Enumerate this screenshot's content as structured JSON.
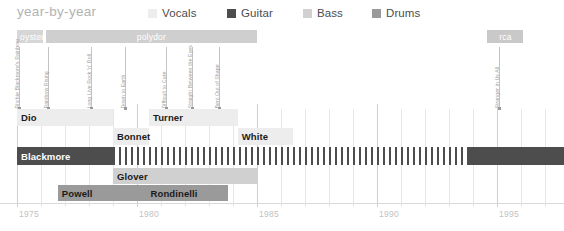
{
  "header": {
    "title": "year-by-year",
    "legend": [
      {
        "label": "Vocals",
        "color": "#ededed",
        "x": 148
      },
      {
        "label": "Guitar",
        "color": "#4d4d4d",
        "x": 227
      },
      {
        "label": "Bass",
        "color": "#d0d0d0",
        "x": 303
      },
      {
        "label": "Drums",
        "color": "#9a9a9a",
        "x": 372
      }
    ]
  },
  "chart_data": {
    "type": "timeline",
    "title": "year-by-year",
    "xlabel": "",
    "ylabel": "",
    "xlim": [
      1975,
      1997.8
    ],
    "x_ticks": [
      1975,
      1980,
      1985,
      1990,
      1995
    ],
    "x_tick_labels": [
      "1975",
      "1980",
      "1985",
      "1990",
      "1995"
    ],
    "x_minor_ticks": [
      1976,
      1977,
      1978,
      1979,
      1981,
      1982,
      1983,
      1984,
      1986,
      1987,
      1988,
      1989,
      1991,
      1992,
      1993,
      1994,
      1996,
      1997
    ],
    "grid": true,
    "legend_position": "top",
    "pixels_per_year": 24,
    "origin_x": 17,
    "record_labels": [
      {
        "name": "oyster",
        "start": 1975.0,
        "end": 1976.1,
        "color": "#d6d6d6",
        "align": "left"
      },
      {
        "name": "polydor",
        "start": 1976.2,
        "end": 1985.0,
        "color": "#cfcfcf",
        "align": "center"
      },
      {
        "name": "rca",
        "start": 1994.6,
        "end": 1996.1,
        "color": "#c9c9c9",
        "align": "center"
      }
    ],
    "albums": [
      {
        "title": "Ritchie Blackmore's Rainbow",
        "year": 1975.1
      },
      {
        "title": "Rainbow Rising",
        "year": 1976.3
      },
      {
        "title": "Long Live Rock 'n' Roll",
        "year": 1978.1
      },
      {
        "title": "Down to Earth",
        "year": 1979.5
      },
      {
        "title": "Difficult to Cure",
        "year": 1981.2
      },
      {
        "title": "Straight Between the Eyes",
        "year": 1982.3
      },
      {
        "title": "Bent Out of Shape",
        "year": 1983.4
      }
    ],
    "albums_right": [
      {
        "title": "Stranger in Us All",
        "year": 1995.1
      }
    ],
    "rows": [
      {
        "instrument": "Vocals",
        "color": "#ededed",
        "text_color": "#1a1a1a",
        "segments": [
          {
            "name": "Dio",
            "start": 1975.0,
            "end": 1979.0
          },
          {
            "name": "Turner",
            "start": 1980.5,
            "end": 1984.2
          }
        ]
      },
      {
        "instrument": "Vocals",
        "color": "#ededed",
        "text_color": "#1a1a1a",
        "segments": [
          {
            "name": "Bonnet",
            "start": 1979.0,
            "end": 1980.5
          },
          {
            "name": "White",
            "start": 1984.2,
            "end": 1986.5
          }
        ]
      },
      {
        "instrument": "Guitar",
        "color": "#4d4d4d",
        "text_color": "#ffffff",
        "segments": [
          {
            "name": "Blackmore",
            "start": 1975.0,
            "end": 1979.0,
            "pattern": "solid"
          },
          {
            "name": "",
            "start": 1979.0,
            "end": 1993.8,
            "pattern": "hatch"
          },
          {
            "name": "",
            "start": 1993.8,
            "end": 1997.8,
            "pattern": "solid"
          }
        ]
      },
      {
        "instrument": "Bass",
        "color": "#d0d0d0",
        "text_color": "#1a1a1a",
        "segments": [
          {
            "name": "Glover",
            "start": 1979.0,
            "end": 1985.0
          }
        ]
      },
      {
        "instrument": "Drums",
        "color": "#9a9a9a",
        "text_color": "#1a1a1a",
        "segments": [
          {
            "name": "Powell",
            "start": 1976.7,
            "end": 1980.4
          },
          {
            "name": "Rondinelli",
            "start": 1980.4,
            "end": 1983.8
          }
        ]
      }
    ]
  }
}
